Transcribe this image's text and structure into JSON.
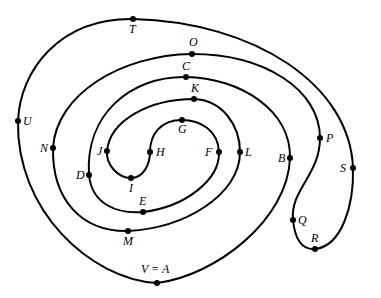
{
  "diagram": {
    "type": "closed-curve-spiral",
    "stroke_color": "#000000",
    "background": "#ffffff",
    "point_order": [
      "A",
      "B",
      "C",
      "D",
      "E",
      "F",
      "G",
      "H",
      "I",
      "J",
      "K",
      "L",
      "M",
      "N",
      "O",
      "P",
      "Q",
      "R",
      "S",
      "T",
      "U",
      "V"
    ],
    "points": {
      "A": {
        "label": "V = A",
        "x": 157,
        "y": 283
      },
      "B": {
        "label": "B",
        "x": 290,
        "y": 158
      },
      "C": {
        "label": "C",
        "x": 186,
        "y": 77
      },
      "D": {
        "label": "D",
        "x": 89,
        "y": 175
      },
      "E": {
        "label": "E",
        "x": 143,
        "y": 212
      },
      "F": {
        "label": "F",
        "x": 219,
        "y": 152
      },
      "G": {
        "label": "G",
        "x": 182,
        "y": 120
      },
      "H": {
        "label": "H",
        "x": 150,
        "y": 152
      },
      "I": {
        "label": "I",
        "x": 131,
        "y": 178
      },
      "J": {
        "label": "J",
        "x": 107,
        "y": 151
      },
      "K": {
        "label": "K",
        "x": 194,
        "y": 99
      },
      "L": {
        "label": "L",
        "x": 240,
        "y": 152
      },
      "M": {
        "label": "M",
        "x": 128,
        "y": 231
      },
      "N": {
        "label": "N",
        "x": 53,
        "y": 148
      },
      "O": {
        "label": "O",
        "x": 192,
        "y": 54
      },
      "P": {
        "label": "P",
        "x": 320,
        "y": 138
      },
      "Q": {
        "label": "Q",
        "x": 293,
        "y": 220
      },
      "R": {
        "label": "R",
        "x": 315,
        "y": 249
      },
      "S": {
        "label": "S",
        "x": 353,
        "y": 168
      },
      "T": {
        "label": "T",
        "x": 133,
        "y": 19
      },
      "U": {
        "label": "U",
        "x": 18,
        "y": 121
      }
    },
    "labels": {
      "A": "V = A",
      "B": "B",
      "C": "C",
      "D": "D",
      "E": "E",
      "F": "F",
      "G": "G",
      "H": "H",
      "I": "I",
      "J": "J",
      "K": "K",
      "L": "L",
      "M": "M",
      "N": "N",
      "O": "O",
      "P": "P",
      "Q": "Q",
      "R": "R",
      "S": "S",
      "T": "T",
      "U": "U"
    }
  }
}
